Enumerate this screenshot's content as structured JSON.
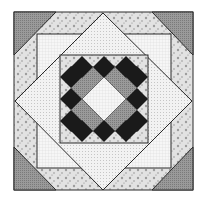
{
  "figure": {
    "colors": {
      "background": "#ffffff",
      "outline": "#2a2a2a",
      "corner_triangle": "#8a8a8a",
      "floral_band": "#d4d4d4",
      "light_dot": "#ececec",
      "big_diamond": "#e4e4e4",
      "center_grey": "#9a9a9a",
      "black_diamond": "#1a1a1a",
      "center_white": "#f4f4f4"
    }
  }
}
